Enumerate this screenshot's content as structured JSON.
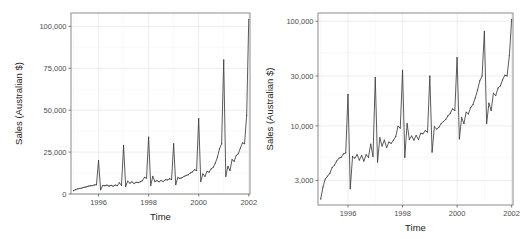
{
  "figure": {
    "title": "",
    "background_color": "#ffffff",
    "panel_count": 2
  },
  "panels": {
    "left": {
      "name": "linear-scale-panel",
      "xlabel": "Time",
      "ylabel": "Sales (Australian $)",
      "yscale": "linear",
      "xticks": [
        "1996",
        "1998",
        "2000",
        "2002"
      ],
      "yticks": [
        "0",
        "25,000",
        "50,000",
        "75,000",
        "100,000"
      ]
    },
    "right": {
      "name": "log-scale-panel",
      "xlabel": "Time",
      "ylabel": "Sales (Australian $)",
      "yscale": "log",
      "xticks": [
        "1996",
        "1998",
        "2000",
        "2002"
      ],
      "yticks": [
        "3,000",
        "10,000",
        "30,000",
        "100,000"
      ]
    }
  },
  "chart_data": [
    {
      "type": "line",
      "panel": "left",
      "title": "",
      "xlabel": "Time",
      "ylabel": "Sales (Australian $)",
      "yscale": "linear",
      "xlim": [
        1994.9,
        2002.05
      ],
      "ylim": [
        0,
        108000
      ],
      "xticks": [
        1996,
        1998,
        2000,
        2002
      ],
      "xticklabels": [
        "1996",
        "1998",
        "2000",
        "2002"
      ],
      "yticks": [
        0,
        25000,
        50000,
        75000,
        100000
      ],
      "yticklabels": [
        "0",
        "25,000",
        "50,000",
        "75,000",
        "100,000"
      ],
      "grid": true,
      "legend": "none",
      "series": [
        {
          "name": "Sales",
          "x": [
            1995.0,
            1995.083,
            1995.167,
            1995.25,
            1995.333,
            1995.417,
            1995.5,
            1995.583,
            1995.667,
            1995.75,
            1995.833,
            1995.917,
            1996.0,
            1996.083,
            1996.167,
            1996.25,
            1996.333,
            1996.417,
            1996.5,
            1996.583,
            1996.667,
            1996.75,
            1996.833,
            1996.917,
            1997.0,
            1997.083,
            1997.167,
            1997.25,
            1997.333,
            1997.417,
            1997.5,
            1997.583,
            1997.667,
            1997.75,
            1997.833,
            1997.917,
            1998.0,
            1998.083,
            1998.167,
            1998.25,
            1998.333,
            1998.417,
            1998.5,
            1998.583,
            1998.667,
            1998.75,
            1998.833,
            1998.917,
            1999.0,
            1999.083,
            1999.167,
            1999.25,
            1999.333,
            1999.417,
            1999.5,
            1999.583,
            1999.667,
            1999.75,
            1999.833,
            1999.917,
            2000.0,
            2000.083,
            2000.167,
            2000.25,
            2000.333,
            2000.417,
            2000.5,
            2000.583,
            2000.667,
            2000.75,
            2000.833,
            2000.917,
            2001.0,
            2001.083,
            2001.167,
            2001.25,
            2001.333,
            2001.417,
            2001.5,
            2001.583,
            2001.667,
            2001.75,
            2001.833,
            2001.917,
            2002.0
          ],
          "y": [
            2000,
            2600,
            3100,
            3300,
            3500,
            4000,
            4200,
            4600,
            4900,
            5000,
            5400,
            5500,
            20000,
            2500,
            5100,
            4900,
            5300,
            4700,
            5200,
            4600,
            5300,
            5000,
            6700,
            5100,
            29000,
            4500,
            7700,
            6400,
            7300,
            6200,
            7000,
            6800,
            7300,
            7900,
            9900,
            9500,
            34000,
            5000,
            10500,
            7400,
            8000,
            7300,
            8100,
            7400,
            8500,
            8400,
            9000,
            8700,
            30000,
            5600,
            9800,
            9300,
            9700,
            10500,
            11000,
            11500,
            12500,
            13200,
            14500,
            14000,
            45000,
            7500,
            12000,
            10500,
            13500,
            13000,
            15000,
            16000,
            18500,
            22000,
            27000,
            30000,
            80000,
            10500,
            16500,
            14000,
            20500,
            19500,
            23000,
            24000,
            27500,
            30500,
            30000,
            47000,
            104000
          ]
        }
      ]
    },
    {
      "type": "line",
      "panel": "right",
      "title": "",
      "xlabel": "Time",
      "ylabel": "Sales (Australian $)",
      "yscale": "log",
      "xlim": [
        1994.9,
        2002.05
      ],
      "ylim": [
        1750,
        120000
      ],
      "xticks": [
        1996,
        1998,
        2000,
        2002
      ],
      "xticklabels": [
        "1996",
        "1998",
        "2000",
        "2002"
      ],
      "yticks": [
        3000,
        10000,
        30000,
        100000
      ],
      "yticklabels": [
        "3,000",
        "10,000",
        "30,000",
        "100,000"
      ],
      "grid": true,
      "legend": "none",
      "series": [
        {
          "name": "Sales",
          "x": [
            1995.0,
            1995.083,
            1995.167,
            1995.25,
            1995.333,
            1995.417,
            1995.5,
            1995.583,
            1995.667,
            1995.75,
            1995.833,
            1995.917,
            1996.0,
            1996.083,
            1996.167,
            1996.25,
            1996.333,
            1996.417,
            1996.5,
            1996.583,
            1996.667,
            1996.75,
            1996.833,
            1996.917,
            1997.0,
            1997.083,
            1997.167,
            1997.25,
            1997.333,
            1997.417,
            1997.5,
            1997.583,
            1997.667,
            1997.75,
            1997.833,
            1997.917,
            1998.0,
            1998.083,
            1998.167,
            1998.25,
            1998.333,
            1998.417,
            1998.5,
            1998.583,
            1998.667,
            1998.75,
            1998.833,
            1998.917,
            1999.0,
            1999.083,
            1999.167,
            1999.25,
            1999.333,
            1999.417,
            1999.5,
            1999.583,
            1999.667,
            1999.75,
            1999.833,
            1999.917,
            2000.0,
            2000.083,
            2000.167,
            2000.25,
            2000.333,
            2000.417,
            2000.5,
            2000.583,
            2000.667,
            2000.75,
            2000.833,
            2000.917,
            2001.0,
            2001.083,
            2001.167,
            2001.25,
            2001.333,
            2001.417,
            2001.5,
            2001.583,
            2001.667,
            2001.75,
            2001.833,
            2001.917,
            2002.0
          ],
          "y": [
            2000,
            2600,
            3100,
            3300,
            3500,
            4000,
            4200,
            4600,
            4900,
            5000,
            5400,
            5500,
            20000,
            2500,
            5100,
            4900,
            5300,
            4700,
            5200,
            4600,
            5300,
            5000,
            6700,
            5100,
            29000,
            4500,
            7700,
            6400,
            7300,
            6200,
            7000,
            6800,
            7300,
            7900,
            9900,
            9500,
            34000,
            5000,
            10500,
            7400,
            8000,
            7300,
            8100,
            7400,
            8500,
            8400,
            9000,
            8700,
            30000,
            5600,
            9800,
            9300,
            9700,
            10500,
            11000,
            11500,
            12500,
            13200,
            14500,
            14000,
            45000,
            7500,
            12000,
            10500,
            13500,
            13000,
            15000,
            16000,
            18500,
            22000,
            27000,
            30000,
            80000,
            10500,
            16500,
            14000,
            20500,
            19500,
            23000,
            24000,
            27500,
            30500,
            30000,
            47000,
            104000
          ]
        }
      ]
    }
  ],
  "style": {
    "line_color": "#3d3d3d",
    "grid_color": "#e8e8e8",
    "panel_border_color": "#8c8c8c",
    "panel_background": "#ffffff",
    "tick_label_color": "#4d4d4d",
    "axis_title_color": "#1a1a1a"
  }
}
